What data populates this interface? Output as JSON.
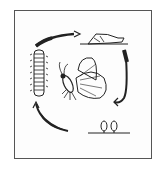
{
  "diagram": {
    "type": "life-cycle",
    "stages": [
      {
        "id": "egg",
        "icon": "eggs-icon"
      },
      {
        "id": "larva",
        "icon": "caterpillar-icon"
      },
      {
        "id": "pupa",
        "icon": "pupa-icon"
      },
      {
        "id": "adult",
        "icon": "butterfly-icon"
      }
    ],
    "arrows": [
      {
        "from": "egg",
        "to": "larva",
        "icon": "curved-arrow-icon"
      },
      {
        "from": "larva",
        "to": "pupa",
        "icon": "curved-arrow-icon"
      },
      {
        "from": "pupa",
        "to": "adult",
        "icon": "curved-arrow-icon"
      }
    ],
    "colors": {
      "ink": "#222222",
      "frame": "#555555",
      "background": "#ffffff"
    }
  }
}
